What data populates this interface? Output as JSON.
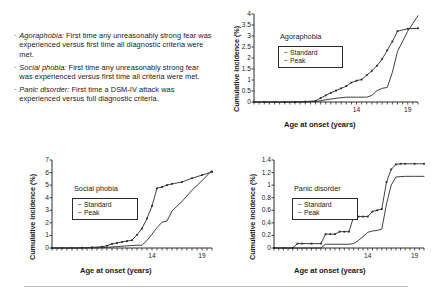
{
  "notes": {
    "bullet_glyph": "·",
    "items": [
      {
        "term": "Agoraphobia:",
        "text": " First time any unreasonably strong fear was experienced versus first time all diagnostic criteria were met."
      },
      {
        "term": "Social phobia:",
        "text": " First time any unreasonably strong fear was experienced versus first time all criteria were met."
      },
      {
        "term": "Panic disorder:",
        "text": " First time a DSM-IV attack was experienced versus full diagnostic criteria."
      }
    ]
  },
  "common": {
    "xlabel": "Age at onset (years)",
    "ylabel": "Cumulative incidence (%)",
    "legend_standard": "Standard",
    "legend_peak": "Peak",
    "marker_standard": "−",
    "marker_peak": "−",
    "axis_color": "#2a2a2a",
    "line_color": "#2a2a2a"
  },
  "chart_data": [
    {
      "id": "agoraphobia",
      "type": "line",
      "title": "Agoraphobia",
      "xlabel": "Age at onset (years)",
      "ylabel": "Cumulative incidence (%)",
      "xlim": [
        4,
        20
      ],
      "ylim": [
        0,
        4
      ],
      "yticks": [
        0,
        0.5,
        1,
        1.5,
        2,
        2.5,
        3,
        3.5,
        4
      ],
      "ytick_labels": [
        "0",
        "0.5",
        "1",
        "1.5",
        "2",
        "2.5",
        "3",
        "3.5",
        "4"
      ],
      "xticks": [
        14,
        19
      ],
      "xtick_labels": [
        "14",
        "19"
      ],
      "grid": false,
      "legend_position": "upper-left",
      "series": [
        {
          "name": "Standard",
          "markers": true,
          "x": [
            4,
            5,
            6,
            7,
            8,
            9,
            10,
            10.5,
            11,
            11.5,
            12,
            12.5,
            13,
            13.5,
            14,
            14.5,
            15,
            15.5,
            16,
            16.5,
            17,
            17.5,
            18,
            19,
            20
          ],
          "values": [
            0,
            0,
            0,
            0,
            0,
            0.02,
            0.05,
            0.18,
            0.3,
            0.42,
            0.52,
            0.62,
            0.72,
            0.88,
            0.97,
            1.02,
            1.22,
            1.42,
            1.65,
            1.95,
            2.35,
            2.75,
            3.22,
            3.33,
            3.35
          ]
        },
        {
          "name": "Peak",
          "markers": false,
          "x": [
            4,
            8,
            9,
            10,
            11,
            12,
            13,
            14,
            15,
            15.5,
            16,
            16.5,
            17,
            17.5,
            18,
            19,
            20
          ],
          "values": [
            0,
            0,
            0,
            0.02,
            0.1,
            0.17,
            0.22,
            0.22,
            0.22,
            0.3,
            0.52,
            0.62,
            0.66,
            1.35,
            2.3,
            3.22,
            3.92
          ]
        }
      ]
    },
    {
      "id": "social-phobia",
      "type": "line",
      "title": "Social phobia",
      "xlabel": "Age at onset (years)",
      "ylabel": "Cumulative incidence (%)",
      "xlim": [
        4,
        20
      ],
      "ylim": [
        0,
        7
      ],
      "yticks": [
        0,
        1,
        2,
        3,
        4,
        5,
        6,
        7
      ],
      "ytick_labels": [
        "0",
        "1",
        "2",
        "3",
        "4",
        "5",
        "6",
        "7"
      ],
      "xticks": [
        14,
        19
      ],
      "xtick_labels": [
        "14",
        "19"
      ],
      "grid": false,
      "legend_position": "upper-left",
      "series": [
        {
          "name": "Standard",
          "markers": true,
          "x": [
            4,
            5,
            6,
            7,
            8,
            9,
            9.5,
            10,
            10.5,
            11,
            11.5,
            12,
            12.5,
            13,
            13.5,
            14,
            14.5,
            15,
            15.5,
            16,
            17,
            18,
            19,
            20
          ],
          "values": [
            0,
            0,
            0,
            0.02,
            0.05,
            0.1,
            0.18,
            0.33,
            0.4,
            0.48,
            0.55,
            0.62,
            1.05,
            1.55,
            2.35,
            3.35,
            4.75,
            4.85,
            5.0,
            5.1,
            5.25,
            5.55,
            5.8,
            6.05
          ]
        },
        {
          "name": "Peak",
          "markers": false,
          "x": [
            4,
            8,
            9,
            10,
            11,
            12,
            12.5,
            13,
            13.5,
            14,
            14.5,
            15,
            15.5,
            16,
            17,
            18,
            19,
            20
          ],
          "values": [
            0,
            0,
            0.03,
            0.08,
            0.14,
            0.2,
            0.22,
            0.22,
            0.6,
            1.1,
            1.62,
            2.05,
            2.15,
            2.95,
            3.7,
            4.6,
            5.35,
            6.18
          ]
        }
      ]
    },
    {
      "id": "panic-disorder",
      "type": "line",
      "title": "Panic disorder",
      "xlabel": "Age at onset (years)",
      "ylabel": "Cumulative incidence (%)",
      "xlim": [
        4,
        20
      ],
      "ylim": [
        0,
        1.4
      ],
      "yticks": [
        0,
        0.2,
        0.4,
        0.6,
        0.8,
        1,
        1.2,
        1.4
      ],
      "ytick_labels": [
        "0",
        "0.2",
        "0.4",
        "0.6",
        "0.8",
        "1",
        "1.2",
        "1.4"
      ],
      "xticks": [
        14,
        19
      ],
      "xtick_labels": [
        "14",
        "19"
      ],
      "grid": false,
      "legend_position": "upper-left",
      "series": [
        {
          "name": "Standard",
          "markers": true,
          "x": [
            4,
            5,
            6,
            6.5,
            7,
            8,
            9,
            9.5,
            10,
            10.5,
            11,
            11.5,
            12,
            12.5,
            13,
            13.5,
            14,
            14.5,
            15,
            15.5,
            16,
            16.5,
            17,
            17.5,
            18,
            19,
            20
          ],
          "values": [
            0,
            0,
            0,
            0.07,
            0.07,
            0.07,
            0.07,
            0.22,
            0.22,
            0.22,
            0.26,
            0.26,
            0.26,
            0.5,
            0.5,
            0.5,
            0.5,
            0.58,
            0.6,
            0.62,
            1.05,
            1.25,
            1.33,
            1.34,
            1.34,
            1.34,
            1.34
          ]
        },
        {
          "name": "Peak",
          "markers": false,
          "x": [
            4,
            9,
            9.5,
            10,
            11,
            12,
            12.5,
            13,
            13.5,
            14,
            14.5,
            15,
            15.5,
            16,
            16.5,
            17,
            18,
            19,
            20
          ],
          "values": [
            0,
            0,
            0.06,
            0.06,
            0.06,
            0.06,
            0.07,
            0.12,
            0.18,
            0.25,
            0.27,
            0.28,
            0.3,
            0.7,
            1.0,
            1.13,
            1.14,
            1.14,
            1.14
          ]
        }
      ]
    }
  ]
}
